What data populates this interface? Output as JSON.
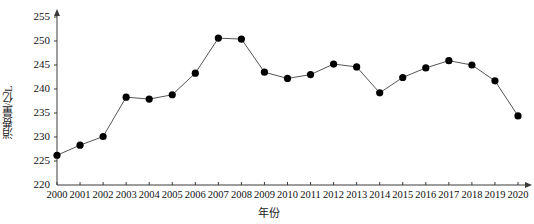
{
  "chart_data": {
    "type": "line",
    "title": "",
    "xlabel": "年份",
    "ylabel": "消费量/亿L",
    "ylim": [
      220,
      255
    ],
    "y_ticks": [
      220,
      225,
      230,
      235,
      240,
      245,
      250,
      255
    ],
    "x_ticks": [
      "2000",
      "2001",
      "2002",
      "2003",
      "2004",
      "2005",
      "2006",
      "2007",
      "2008",
      "2009",
      "2010",
      "2011",
      "2012",
      "2013",
      "2014",
      "2015",
      "2016",
      "2017",
      "2018",
      "2019",
      "2020"
    ],
    "grid": false,
    "legend": null,
    "marker": "filled-circle",
    "marker_color": "#000000",
    "line_color": "#555555",
    "categories": [
      2000,
      2001,
      2002,
      2003,
      2004,
      2005,
      2006,
      2007,
      2008,
      2009,
      2010,
      2011,
      2012,
      2013,
      2014,
      2015,
      2016,
      2017,
      2018,
      2019,
      2020
    ],
    "values": [
      226.2,
      228.3,
      230.1,
      238.3,
      237.9,
      238.8,
      243.3,
      250.6,
      250.4,
      243.5,
      242.2,
      243.0,
      245.2,
      244.6,
      239.2,
      242.4,
      244.4,
      245.9,
      245.0,
      241.7,
      234.4
    ],
    "series": [
      {
        "name": "消费量",
        "values": [
          226.2,
          228.3,
          230.1,
          238.3,
          237.9,
          238.8,
          243.3,
          250.6,
          250.4,
          243.5,
          242.2,
          243.0,
          245.2,
          244.6,
          239.2,
          242.4,
          244.4,
          245.9,
          245.0,
          241.7,
          234.4
        ]
      }
    ]
  },
  "axes": {
    "y_title": "消费量/亿L",
    "x_title": "年份"
  }
}
